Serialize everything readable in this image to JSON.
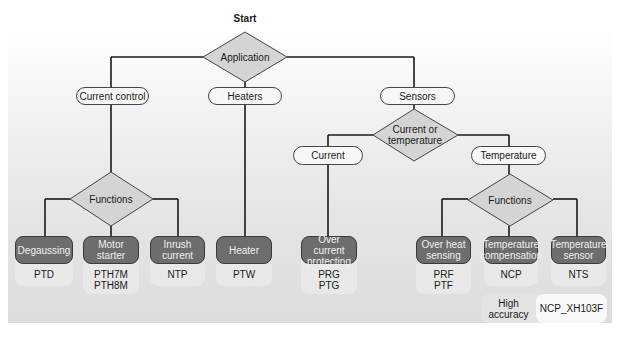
{
  "diagram": {
    "start_label": "Start",
    "root_decision": "Application",
    "categories": {
      "current_control": "Current control",
      "heaters": "Heaters",
      "sensors": "Sensors"
    },
    "sensor_decision": "Current or temperature",
    "sensor_branches": {
      "current": "Current",
      "temperature": "Temperature"
    },
    "functions_left": "Functions",
    "functions_right": "Functions",
    "leaves": [
      {
        "name": "Degaussing",
        "codes": "PTD"
      },
      {
        "name": "Motor starter",
        "codes": "PTH7M\nPTH8M"
      },
      {
        "name": "Inrush current",
        "codes": "NTP"
      },
      {
        "name": "Heater",
        "codes": "PTW"
      },
      {
        "name": "Over current protecting",
        "codes": "PRG\nPTG"
      },
      {
        "name": "Over heat sensing",
        "codes": "PRF\nPTF"
      },
      {
        "name": "Temperature compensation",
        "codes": "NCP"
      },
      {
        "name": "Temperature sensor",
        "codes": "NTS"
      }
    ],
    "leaf_lines": {
      "degaussing": [
        "Degaussing"
      ],
      "motor": [
        "Motor",
        "starter"
      ],
      "inrush": [
        "Inrush",
        "current"
      ],
      "heater": [
        "Heater"
      ],
      "overcurrent": [
        "Over current",
        "protecting"
      ],
      "overheat": [
        "Over heat",
        "sensing"
      ],
      "tempcomp": [
        "Temperature",
        "compensation"
      ],
      "tempsensor": [
        "Temperature",
        "sensor"
      ]
    },
    "code_lines": {
      "degaussing": [
        "PTD"
      ],
      "motor": [
        "PTH7M",
        "PTH8M"
      ],
      "inrush": [
        "NTP"
      ],
      "heater": [
        "PTW"
      ],
      "overcurrent": [
        "PRG",
        "PTG"
      ],
      "overheat": [
        "PRF",
        "PTF"
      ],
      "tempcomp": [
        "NCP"
      ],
      "tempsensor": [
        "NTS"
      ]
    },
    "sensor_decision_lines": [
      "Current or",
      "temperature"
    ],
    "high_accuracy": {
      "label_lines": [
        "High",
        "accuracy"
      ],
      "code": "NCP_XH103F"
    }
  },
  "colors": {
    "leaf_fill": "#6d6d6d",
    "pill_fill": "#f7f7f7",
    "diamond_fill": "#d4d4d4",
    "line": "#1a1a1a"
  }
}
